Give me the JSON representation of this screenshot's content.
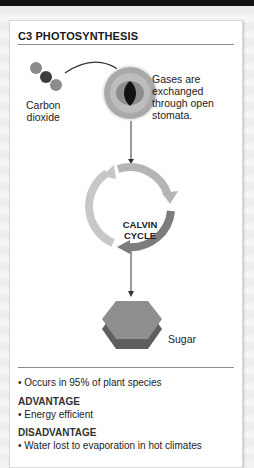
{
  "diagram": {
    "title": "C3 PHOTOSYNTHESIS",
    "labels": {
      "carbon_dioxide_line1": "Carbon",
      "carbon_dioxide_line2": "dioxide",
      "gases_line1": "Gases are",
      "gases_line2": "exchanged",
      "gases_line3": "through open",
      "gases_line4": "stomata.",
      "calvin_line1": "CALVIN",
      "calvin_line2": "CYCLE",
      "sugar": "Sugar"
    },
    "facts": {
      "occurrence": "• Occurs in 95% of plant species",
      "advantage_heading": "ADVANTAGE",
      "advantage_item": "• Energy efficient",
      "disadvantage_heading": "DISADVANTAGE",
      "disadvantage_item": "• Water lost to evaporation in hot climates"
    },
    "colors": {
      "topbar": "#151515",
      "cycle_light": "#bdbdbd",
      "cycle_mid": "#9a9a9a",
      "cycle_dark": "#7a7a7a",
      "hexagon_top": "#8f8f8f",
      "hexagon_side": "#5e5e5e"
    }
  }
}
